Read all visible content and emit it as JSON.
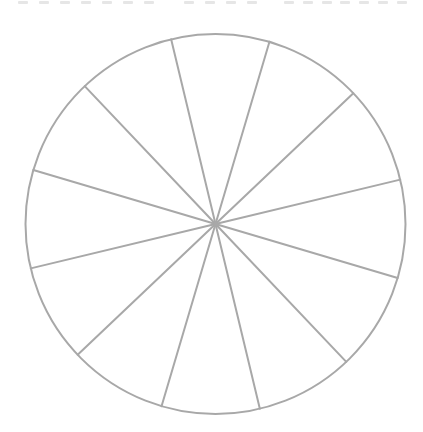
{
  "title": {
    "text": "",
    "note_visible": "clipped uppercase heading at top edge; only letter bottoms visible",
    "word_groups": [
      {
        "x": 17,
        "width": 138,
        "glyph_count": 7
      },
      {
        "x": 183,
        "width": 75,
        "glyph_count": 4
      },
      {
        "x": 283,
        "width": 125,
        "glyph_count": 7
      }
    ],
    "color": "#e6e6e6"
  },
  "wheel": {
    "center": {
      "x": 215.5,
      "y": 224
    },
    "radius": 190,
    "segments": 12,
    "start_angle_deg": -13.5,
    "stroke_color": "#a8a8a8",
    "stroke_width": 2,
    "fill_color": "#ffffff",
    "labels": []
  },
  "chart_data": {
    "type": "pie",
    "title": "",
    "categories": [
      "",
      "",
      "",
      "",
      "",
      "",
      "",
      "",
      "",
      "",
      "",
      ""
    ],
    "values": [
      1,
      1,
      1,
      1,
      1,
      1,
      1,
      1,
      1,
      1,
      1,
      1
    ],
    "legend": [],
    "start_angle_deg": -13.5,
    "colors": [
      "#ffffff"
    ],
    "stroke_color": "#a8a8a8"
  }
}
